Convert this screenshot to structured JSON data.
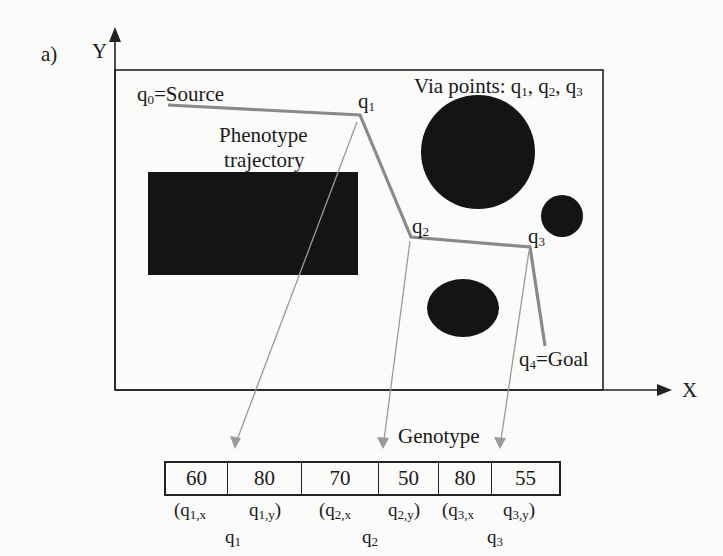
{
  "panel_label": "a)",
  "axes": {
    "x_label": "X",
    "y_label": "Y"
  },
  "labels": {
    "source": {
      "base": "q",
      "sub": "0",
      "text": "=Source"
    },
    "goal": {
      "base": "q",
      "sub": "4",
      "text": "=Goal"
    },
    "via_title": "Via points: ",
    "via_points": [
      {
        "base": "q",
        "sub": "1"
      },
      {
        "base": "q",
        "sub": "2"
      },
      {
        "base": "q",
        "sub": "3"
      }
    ],
    "phenotype_line1": "Phenotype",
    "phenotype_line2": "trajectory",
    "q1": {
      "base": "q",
      "sub": "1"
    },
    "q2": {
      "base": "q",
      "sub": "2"
    },
    "q3": {
      "base": "q",
      "sub": "3"
    },
    "genotype": "Genotype"
  },
  "trajectory_points": [
    {
      "name": "q0",
      "x": 168,
      "y": 105
    },
    {
      "name": "q1",
      "x": 360,
      "y": 115
    },
    {
      "name": "q2",
      "x": 411,
      "y": 237
    },
    {
      "name": "q3",
      "x": 530,
      "y": 247
    },
    {
      "name": "q4",
      "x": 545,
      "y": 346
    }
  ],
  "obstacles": [
    {
      "shape": "rect",
      "x": 148,
      "y": 172,
      "w": 210,
      "h": 103
    },
    {
      "shape": "circle",
      "cx": 478,
      "cy": 152,
      "rx": 57,
      "ry": 57
    },
    {
      "shape": "circle",
      "cx": 562,
      "cy": 216,
      "rx": 21,
      "ry": 21
    },
    {
      "shape": "ellipse",
      "cx": 463,
      "cy": 308,
      "rx": 36,
      "ry": 29
    }
  ],
  "genotype": {
    "cells": [
      {
        "value": "60",
        "width": 62
      },
      {
        "value": "80",
        "width": 74
      },
      {
        "value": "70",
        "width": 77
      },
      {
        "value": "50",
        "width": 60
      },
      {
        "value": "80",
        "width": 53
      },
      {
        "value": "55",
        "width": 67
      }
    ],
    "component_labels": [
      "(q1,x",
      "q1,y)",
      "(q2,x",
      "q2,y)",
      "(q3,x",
      "q3,y)"
    ],
    "group_labels": [
      "q1",
      "q2",
      "q3"
    ]
  },
  "colors": {
    "trajectory": "#8a8a8a",
    "obstacle": "#141414",
    "arrow": "#9a9a9a",
    "frame": "#222222"
  }
}
